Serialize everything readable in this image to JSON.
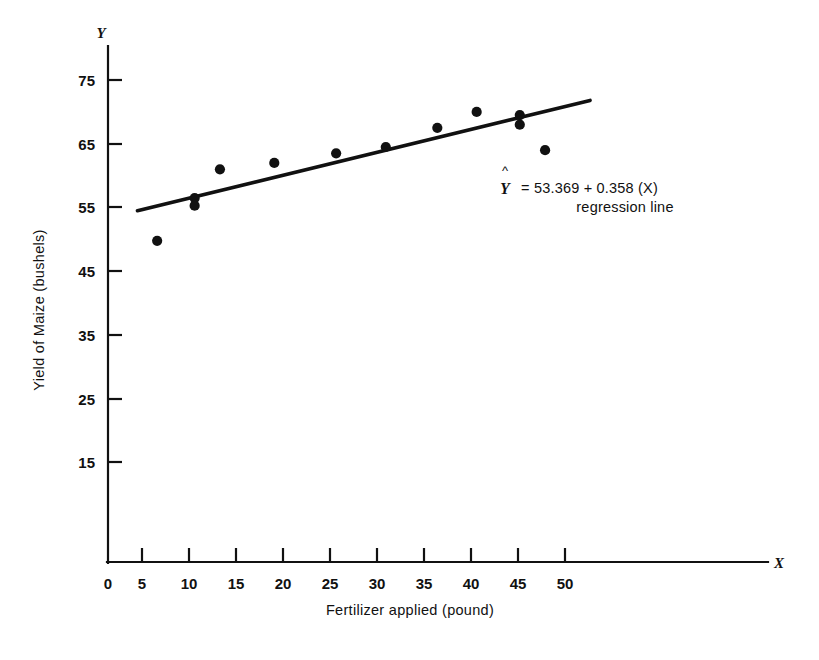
{
  "chart_data": {
    "type": "scatter",
    "title": "",
    "xlabel": "Fertilizer applied (pound)",
    "ylabel": "Yield of Maize (bushels)",
    "x_axis_name": "X",
    "y_axis_name": "Y",
    "xlim": [
      0,
      52.5
    ],
    "ylim": [
      5,
      78
    ],
    "grid": false,
    "xticks": [
      0,
      5,
      10,
      15,
      20,
      25,
      30,
      35,
      40,
      45,
      50
    ],
    "xticklabels": [
      "0",
      "5",
      "10",
      "15",
      "20",
      "25",
      "30",
      "35",
      "40",
      "45",
      "50"
    ],
    "yticks": [
      15,
      25,
      35,
      45,
      55,
      65,
      75
    ],
    "yticklabels": [
      "15",
      "25",
      "35",
      "45",
      "55",
      "65",
      "75"
    ],
    "series": [
      {
        "name": "observations",
        "marker": "filled-circle",
        "color": "#111111",
        "points": [
          {
            "x": 5.3,
            "y": 49.8
          },
          {
            "x": 9.3,
            "y": 56.5
          },
          {
            "x": 9.3,
            "y": 55.3
          },
          {
            "x": 12.0,
            "y": 61.0
          },
          {
            "x": 17.8,
            "y": 62.0
          },
          {
            "x": 24.4,
            "y": 63.5
          },
          {
            "x": 29.7,
            "y": 64.5
          },
          {
            "x": 35.2,
            "y": 67.5
          },
          {
            "x": 39.4,
            "y": 70.0
          },
          {
            "x": 44.0,
            "y": 69.5
          },
          {
            "x": 44.0,
            "y": 68.0
          },
          {
            "x": 46.7,
            "y": 64.0
          }
        ]
      }
    ],
    "fit_line": {
      "name": "regression line",
      "intercept": 53.369,
      "slope": 0.358,
      "x_start": 3.2,
      "x_end": 51.5,
      "color": "#111111"
    },
    "annotations": {
      "equation_hat": "^",
      "equation_var": "Y",
      "equation_body": "=  53.369  +  0.358 (X)",
      "equation_caption": "regression line"
    }
  }
}
